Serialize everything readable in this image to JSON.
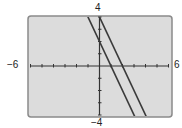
{
  "chart_data": {
    "type": "line",
    "title": "",
    "xlabel": "",
    "ylabel": "",
    "xlim": [
      -6,
      6
    ],
    "ylim": [
      -4,
      4
    ],
    "xscale": 1,
    "yscale": 1,
    "grid": false,
    "tick_labels": {
      "xmin": "−6",
      "xmax": "6",
      "ymin": "−4",
      "ymax": "4"
    },
    "series": [
      {
        "name": "y = -2x + 2",
        "slope": -2,
        "intercept": 2,
        "color": "#3a3a3a"
      },
      {
        "name": "y = -2x + 4",
        "slope": -2,
        "intercept": 4,
        "color": "#3a3a3a"
      }
    ]
  },
  "colors": {
    "background": "#dcdcdc",
    "frame": "#8a8a8a",
    "axis": "#333333"
  }
}
